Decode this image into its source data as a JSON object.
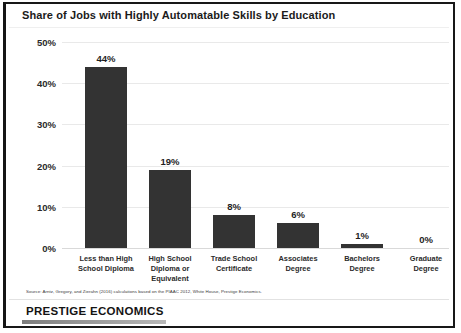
{
  "chart": {
    "title": "Share of Jobs with Highly Automatable Skills by Education"
  },
  "source": {
    "note": "Source: Arntz, Gregory, and Zierahn (2016) calculations based on the PIAAC 2012, White House, Prestige Economics."
  },
  "footer": {
    "brand": "PRESTIGE ECONOMICS"
  },
  "chart_data": {
    "type": "bar",
    "title": "Share of Jobs with Highly Automatable Skills by Education",
    "xlabel": "",
    "ylabel": "",
    "ylim": [
      0,
      50
    ],
    "ytick_labels": [
      "50%",
      "40%",
      "30%",
      "20%",
      "10%",
      "0%"
    ],
    "yticks": [
      50,
      40,
      30,
      20,
      10,
      0
    ],
    "grid": true,
    "legend": false,
    "bar_color": "#333333",
    "categories": [
      "Less than High School Diploma",
      "High School Diploma or Equivalent",
      "Trade School Certificate",
      "Associates Degree",
      "Bachelors Degree",
      "Graduate Degree"
    ],
    "category_lines": [
      [
        "Less than High",
        "School Diploma"
      ],
      [
        "High School",
        "Diploma or",
        "Equivalent"
      ],
      [
        "Trade School",
        "Certificate"
      ],
      [
        "Associates",
        "Degree"
      ],
      [
        "Bachelors",
        "Degree"
      ],
      [
        "Graduate",
        "Degree"
      ]
    ],
    "values": [
      44,
      19,
      8,
      6,
      1,
      0
    ],
    "data_labels": [
      "44%",
      "19%",
      "8%",
      "6%",
      "1%",
      "0%"
    ]
  }
}
